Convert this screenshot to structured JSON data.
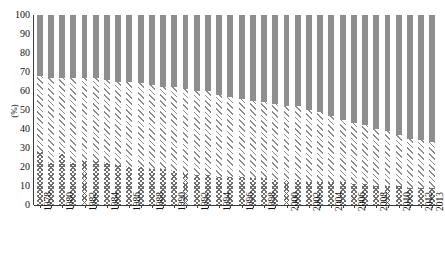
{
  "chart_data": {
    "type": "bar",
    "title": "",
    "subtitle": "",
    "xlabel": "",
    "ylabel": "(%)",
    "ylim": [
      0,
      100
    ],
    "y_ticks": [
      0,
      10,
      20,
      30,
      40,
      50,
      60,
      70,
      80,
      90,
      100
    ],
    "grid": false,
    "legend_position": "none",
    "stacked": true,
    "stack_total": 100,
    "bar_count": 36,
    "categories": [
      "1978",
      "1979",
      "1980",
      "1981",
      "1982",
      "1983",
      "1984",
      "1985",
      "1986",
      "1987",
      "1988",
      "1989",
      "1990",
      "1991",
      "1992",
      "1993",
      "1994",
      "1995",
      "1996",
      "1997",
      "1998",
      "1999",
      "2000",
      "2001",
      "2002",
      "2003",
      "2004",
      "2005",
      "2006",
      "2007",
      "2008",
      "2009",
      "2010",
      "2011",
      "2012",
      "2013"
    ],
    "tick_labels": [
      "1978",
      "",
      "1980",
      "",
      "1982",
      "",
      "1984",
      "",
      "1986",
      "",
      "1988",
      "",
      "1990",
      "",
      "1992",
      "",
      "1994",
      "",
      "1996",
      "",
      "1998",
      "",
      "2000",
      "",
      "2002",
      "",
      "2004",
      "",
      "2006",
      "",
      "2008",
      "",
      "2010",
      "",
      "2012",
      "2013"
    ],
    "series": [
      {
        "name": "x-hatch-segment",
        "pattern": "cross-hatch",
        "color": "#6e6e6e",
        "values": [
          28,
          22,
          27,
          22,
          23,
          23,
          22,
          21,
          20,
          20,
          19,
          19,
          18,
          17,
          16,
          16,
          15,
          15,
          15,
          14,
          14,
          13,
          13,
          13,
          12,
          12,
          12,
          12,
          11,
          11,
          10,
          10,
          10,
          9,
          9,
          9
        ]
      },
      {
        "name": "diagonal-hatch-segment",
        "pattern": "diagonal-hatch",
        "color": "#8d8d8d",
        "values": [
          40,
          45,
          40,
          45,
          44,
          44,
          44,
          44,
          45,
          44,
          44,
          43,
          44,
          44,
          44,
          44,
          43,
          42,
          41,
          41,
          40,
          40,
          39,
          39,
          38,
          37,
          35,
          33,
          32,
          31,
          30,
          29,
          27,
          26,
          25,
          24
        ]
      },
      {
        "name": "solid-segment",
        "pattern": "solid",
        "color": "#8e8e8e",
        "values": [
          32,
          33,
          33,
          33,
          33,
          33,
          34,
          35,
          35,
          36,
          37,
          38,
          38,
          39,
          40,
          40,
          42,
          43,
          44,
          45,
          46,
          47,
          48,
          48,
          50,
          51,
          53,
          55,
          57,
          58,
          60,
          61,
          63,
          65,
          66,
          67
        ]
      }
    ]
  }
}
